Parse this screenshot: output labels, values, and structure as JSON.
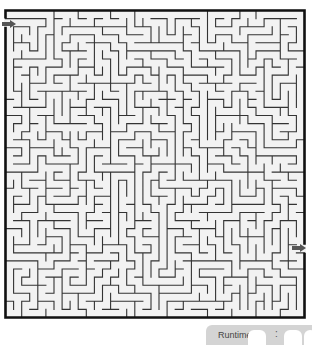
{
  "maze": {
    "cols": 37,
    "rows": 38,
    "seed": 20240611,
    "wall_color": "#333333",
    "border_color": "#111111",
    "background": "#f2f2f2",
    "entry_arrow": {
      "side": "left",
      "color": "#555555"
    },
    "exit_arrow": {
      "side": "right",
      "color": "#555555"
    }
  },
  "runtime": {
    "label": "Runtime",
    "separator": ":",
    "digits": [
      "",
      "",
      "",
      ""
    ]
  }
}
